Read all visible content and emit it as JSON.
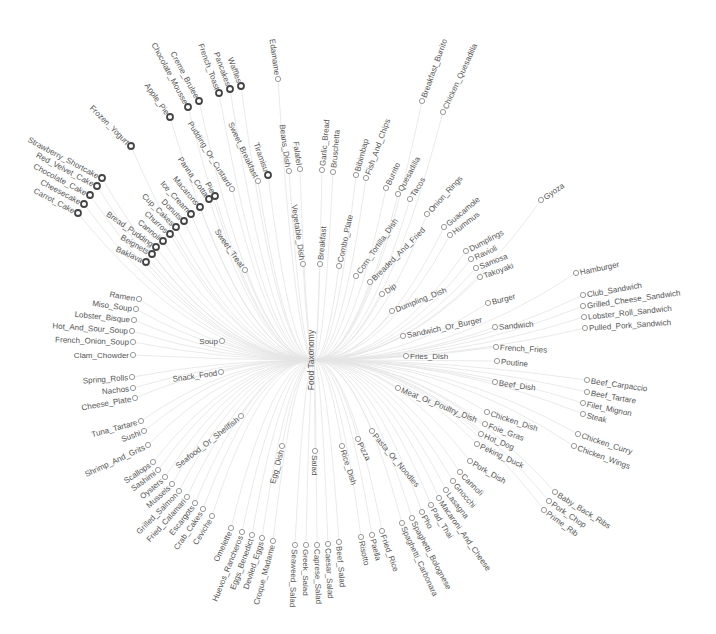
{
  "diagram": {
    "title": "Food Taxonomy",
    "type": "radial-tree",
    "root": {
      "label": "Food Taxonomy",
      "x": 314,
      "y": 360,
      "rot": -90
    },
    "hubs": [
      {
        "label": "Sweet_Treat",
        "x": 245,
        "y": 270,
        "rot": 55,
        "anchor": "end"
      },
      {
        "label": "Soup",
        "x": 222,
        "y": 341,
        "rot": 0,
        "anchor": "end"
      },
      {
        "label": "Snack_Food",
        "x": 221,
        "y": 372,
        "rot": -8,
        "anchor": "end"
      },
      {
        "label": "Seafood_Or_Shellfish",
        "x": 241,
        "y": 416,
        "rot": -38,
        "anchor": "end"
      },
      {
        "label": "Egg_Dish",
        "x": 282,
        "y": 446,
        "rot": -75,
        "anchor": "end"
      },
      {
        "label": "Salad",
        "x": 315,
        "y": 451,
        "rot": 90,
        "anchor": "start"
      },
      {
        "label": "Rice_Dish",
        "x": 342,
        "y": 446,
        "rot": 72,
        "anchor": "start"
      },
      {
        "label": "Pizza",
        "x": 358,
        "y": 439,
        "rot": 62,
        "anchor": "start"
      },
      {
        "label": "Pasta_Or_Noodles",
        "x": 372,
        "y": 431,
        "rot": 50,
        "anchor": "start"
      },
      {
        "label": "Meat_Or_Poultry_Dish",
        "x": 398,
        "y": 388,
        "rot": 22,
        "anchor": "start"
      },
      {
        "label": "Fries_Dish",
        "x": 406,
        "y": 356,
        "rot": 0,
        "anchor": "start"
      },
      {
        "label": "Sandwich_Or_Burger",
        "x": 403,
        "y": 336,
        "rot": -12,
        "anchor": "start"
      },
      {
        "label": "Dumpling_Dish",
        "x": 392,
        "y": 311,
        "rot": -22,
        "anchor": "start"
      },
      {
        "label": "Dip",
        "x": 382,
        "y": 294,
        "rot": -35,
        "anchor": "start"
      },
      {
        "label": "Breaded_And_Fried",
        "x": 370,
        "y": 282,
        "rot": -45,
        "anchor": "start"
      },
      {
        "label": "Corn_Tortilla_Dish",
        "x": 356,
        "y": 276,
        "rot": -55,
        "anchor": "start"
      },
      {
        "label": "Combo_Plate",
        "x": 339,
        "y": 266,
        "rot": -78,
        "anchor": "start"
      },
      {
        "label": "Breakfast",
        "x": 320,
        "y": 264,
        "rot": -85,
        "anchor": "start"
      },
      {
        "label": "Vegetable_Dish",
        "x": 303,
        "y": 264,
        "rot": 82,
        "anchor": "end"
      },
      {
        "label": "Sweet_Breakfast",
        "x": 258,
        "y": 181,
        "rot": 65,
        "anchor": "end"
      },
      {
        "label": "Pudding_Or_Custard",
        "x": 232,
        "y": 189,
        "rot": 58,
        "anchor": "end"
      }
    ],
    "subhubs": [
      {
        "label": "Burger",
        "x": 488,
        "y": 303,
        "rot": -15,
        "anchor": "start"
      },
      {
        "label": "Sandwich",
        "x": 495,
        "y": 327,
        "rot": -5,
        "anchor": "start"
      },
      {
        "label": "Beef_Dish",
        "x": 495,
        "y": 382,
        "rot": 8,
        "anchor": "start"
      },
      {
        "label": "Chicken_Dish",
        "x": 487,
        "y": 412,
        "rot": 18,
        "anchor": "start"
      },
      {
        "label": "Pork_Dish",
        "x": 470,
        "y": 461,
        "rot": 30,
        "anchor": "start"
      }
    ],
    "leaves": [
      {
        "label": "Strawberry_Shortcake",
        "x": 102,
        "y": 178,
        "rot": 28,
        "anchor": "end",
        "dark": true
      },
      {
        "label": "Red_Velvet_Cake",
        "x": 97,
        "y": 186,
        "rot": 28,
        "anchor": "end",
        "dark": true
      },
      {
        "label": "Chocolate_Cake",
        "x": 90,
        "y": 195,
        "rot": 28,
        "anchor": "end",
        "dark": true
      },
      {
        "label": "Cheesecake",
        "x": 84,
        "y": 204,
        "rot": 28,
        "anchor": "end",
        "dark": true
      },
      {
        "label": "Carrot_Cake",
        "x": 78,
        "y": 213,
        "rot": 28,
        "anchor": "end",
        "dark": true
      },
      {
        "label": "Frozen_Yogurt",
        "x": 131,
        "y": 146,
        "rot": 45,
        "anchor": "end",
        "dark": true
      },
      {
        "label": "Apple_Pie",
        "x": 170,
        "y": 117,
        "rot": 55,
        "anchor": "end",
        "dark": true
      },
      {
        "label": "Chocolate_Mousse",
        "x": 188,
        "y": 107,
        "rot": 62,
        "anchor": "end",
        "dark": true
      },
      {
        "label": "Creme_Brulee",
        "x": 199,
        "y": 101,
        "rot": 62,
        "anchor": "end",
        "dark": true
      },
      {
        "label": "French_Toast",
        "x": 219,
        "y": 93,
        "rot": 70,
        "anchor": "end",
        "dark": true
      },
      {
        "label": "Pancakes",
        "x": 230,
        "y": 89,
        "rot": 70,
        "anchor": "end",
        "dark": true
      },
      {
        "label": "Waffles",
        "x": 241,
        "y": 86,
        "rot": 70,
        "anchor": "end",
        "dark": true
      },
      {
        "label": "Edamame",
        "x": 278,
        "y": 79,
        "rot": 82,
        "anchor": "end",
        "dark": false
      },
      {
        "label": "Tiramisu",
        "x": 268,
        "y": 175,
        "rot": 70,
        "anchor": "end",
        "dark": true
      },
      {
        "label": "Panna_Cotta",
        "x": 209,
        "y": 199,
        "rot": 55,
        "anchor": "end",
        "dark": true
      },
      {
        "label": "Pie",
        "x": 215,
        "y": 196,
        "rot": 62,
        "anchor": "end",
        "dark": true
      },
      {
        "label": "Macarons",
        "x": 200,
        "y": 207,
        "rot": 50,
        "anchor": "end",
        "dark": true
      },
      {
        "label": "Ice_Cream",
        "x": 191,
        "y": 214,
        "rot": 48,
        "anchor": "end",
        "dark": true
      },
      {
        "label": "Donuts",
        "x": 184,
        "y": 221,
        "rot": 45,
        "anchor": "end",
        "dark": true
      },
      {
        "label": "Cup_Cakes",
        "x": 176,
        "y": 227,
        "rot": 45,
        "anchor": "end",
        "dark": true
      },
      {
        "label": "Churros",
        "x": 170,
        "y": 234,
        "rot": 42,
        "anchor": "end",
        "dark": true
      },
      {
        "label": "Cannoli",
        "x": 163,
        "y": 241,
        "rot": 40,
        "anchor": "end",
        "dark": true
      },
      {
        "label": "Bread_Pudding",
        "x": 156,
        "y": 247,
        "rot": 35,
        "anchor": "end",
        "dark": true
      },
      {
        "label": "Beignets",
        "x": 152,
        "y": 254,
        "rot": 30,
        "anchor": "end",
        "dark": true
      },
      {
        "label": "Baklava",
        "x": 146,
        "y": 262,
        "rot": 25,
        "anchor": "end",
        "dark": true
      },
      {
        "label": "Beans_Dish",
        "x": 289,
        "y": 171,
        "rot": 82,
        "anchor": "end",
        "dark": false
      },
      {
        "label": "Falafel",
        "x": 300,
        "y": 169,
        "rot": 82,
        "anchor": "end",
        "dark": false
      },
      {
        "label": "Garlic_Bread",
        "x": 322,
        "y": 170,
        "rot": -85,
        "anchor": "start",
        "dark": false
      },
      {
        "label": "Bruschetta",
        "x": 333,
        "y": 172,
        "rot": -85,
        "anchor": "start",
        "dark": false
      },
      {
        "label": "Bibimbap",
        "x": 356,
        "y": 175,
        "rot": -75,
        "anchor": "start",
        "dark": false
      },
      {
        "label": "Fish_And_Chips",
        "x": 366,
        "y": 178,
        "rot": -70,
        "anchor": "start",
        "dark": false
      },
      {
        "label": "Breakfast_Burrito",
        "x": 422,
        "y": 101,
        "rot": -70,
        "anchor": "start",
        "dark": false
      },
      {
        "label": "Chicken_Quesadilla",
        "x": 443,
        "y": 112,
        "rot": -65,
        "anchor": "start",
        "dark": false
      },
      {
        "label": "Burrito",
        "x": 386,
        "y": 188,
        "rot": -65,
        "anchor": "start",
        "dark": false
      },
      {
        "label": "Quesadilla",
        "x": 398,
        "y": 194,
        "rot": -62,
        "anchor": "start",
        "dark": false
      },
      {
        "label": "Tacos",
        "x": 410,
        "y": 199,
        "rot": -58,
        "anchor": "start",
        "dark": false
      },
      {
        "label": "Onion_Rings",
        "x": 427,
        "y": 214,
        "rot": -48,
        "anchor": "start",
        "dark": false
      },
      {
        "label": "Guacamole",
        "x": 444,
        "y": 227,
        "rot": -40,
        "anchor": "start",
        "dark": false
      },
      {
        "label": "Hummus",
        "x": 450,
        "y": 235,
        "rot": -38,
        "anchor": "start",
        "dark": false
      },
      {
        "label": "Gyoza",
        "x": 541,
        "y": 200,
        "rot": -35,
        "anchor": "start",
        "dark": false
      },
      {
        "label": "Dumplings",
        "x": 466,
        "y": 251,
        "rot": -28,
        "anchor": "start",
        "dark": false
      },
      {
        "label": "Ravioli",
        "x": 471,
        "y": 259,
        "rot": -25,
        "anchor": "start",
        "dark": false
      },
      {
        "label": "Samosa",
        "x": 476,
        "y": 268,
        "rot": -22,
        "anchor": "start",
        "dark": false
      },
      {
        "label": "Takoyaki",
        "x": 480,
        "y": 277,
        "rot": -20,
        "anchor": "start",
        "dark": false
      },
      {
        "label": "Hamburger",
        "x": 576,
        "y": 273,
        "rot": -12,
        "anchor": "start",
        "dark": false
      },
      {
        "label": "Club_Sandwich",
        "x": 583,
        "y": 295,
        "rot": -10,
        "anchor": "start",
        "dark": false
      },
      {
        "label": "Grilled_Cheese_Sandwich",
        "x": 583,
        "y": 306,
        "rot": -8,
        "anchor": "start",
        "dark": false
      },
      {
        "label": "Lobster_Roll_Sandwich",
        "x": 584,
        "y": 317,
        "rot": -6,
        "anchor": "start",
        "dark": false
      },
      {
        "label": "Pulled_Pork_Sandwich",
        "x": 585,
        "y": 328,
        "rot": -4,
        "anchor": "start",
        "dark": false
      },
      {
        "label": "French_Fries",
        "x": 496,
        "y": 347,
        "rot": 3,
        "anchor": "start",
        "dark": false
      },
      {
        "label": "Poutine",
        "x": 497,
        "y": 361,
        "rot": 5,
        "anchor": "start",
        "dark": false
      },
      {
        "label": "Beef_Carpaccio",
        "x": 587,
        "y": 380,
        "rot": 8,
        "anchor": "start",
        "dark": false
      },
      {
        "label": "Beef_Tartare",
        "x": 587,
        "y": 392,
        "rot": 10,
        "anchor": "start",
        "dark": false
      },
      {
        "label": "Filet_Mignon",
        "x": 583,
        "y": 403,
        "rot": 12,
        "anchor": "start",
        "dark": false
      },
      {
        "label": "Steak",
        "x": 583,
        "y": 414,
        "rot": 14,
        "anchor": "start",
        "dark": false
      },
      {
        "label": "Foie_Gras",
        "x": 485,
        "y": 424,
        "rot": 20,
        "anchor": "start",
        "dark": false
      },
      {
        "label": "Hot_Dog",
        "x": 481,
        "y": 434,
        "rot": 22,
        "anchor": "start",
        "dark": false
      },
      {
        "label": "Peking_Duck",
        "x": 477,
        "y": 444,
        "rot": 25,
        "anchor": "start",
        "dark": false
      },
      {
        "label": "Chicken_Curry",
        "x": 578,
        "y": 434,
        "rot": 18,
        "anchor": "start",
        "dark": false
      },
      {
        "label": "Chicken_Wings",
        "x": 574,
        "y": 446,
        "rot": 20,
        "anchor": "start",
        "dark": false
      },
      {
        "label": "Baby_Back_Ribs",
        "x": 555,
        "y": 492,
        "rot": 32,
        "anchor": "start",
        "dark": false
      },
      {
        "label": "Pork_Chop",
        "x": 549,
        "y": 501,
        "rot": 34,
        "anchor": "start",
        "dark": false
      },
      {
        "label": "Prime_Rib",
        "x": 544,
        "y": 510,
        "rot": 36,
        "anchor": "start",
        "dark": false
      },
      {
        "label": "Cannoli_Pasta",
        "x": 460,
        "y": 472,
        "rot": 45,
        "anchor": "start",
        "dark": false
      },
      {
        "label": "Gnocchi",
        "x": 453,
        "y": 481,
        "rot": 50,
        "anchor": "start",
        "dark": false
      },
      {
        "label": "Lasagna",
        "x": 446,
        "y": 490,
        "rot": 52,
        "anchor": "start",
        "dark": false
      },
      {
        "label": "Macaroni_And_Cheese",
        "x": 439,
        "y": 498,
        "rot": 55,
        "anchor": "start",
        "dark": false
      },
      {
        "label": "Pad_Thai",
        "x": 431,
        "y": 505,
        "rot": 58,
        "anchor": "start",
        "dark": false
      },
      {
        "label": "Pho",
        "x": 422,
        "y": 512,
        "rot": 60,
        "anchor": "start",
        "dark": false
      },
      {
        "label": "Spaghetti_Bolognese",
        "x": 412,
        "y": 518,
        "rot": 62,
        "anchor": "start",
        "dark": false
      },
      {
        "label": "Spaghetti_Carbonara",
        "x": 402,
        "y": 523,
        "rot": 65,
        "anchor": "start",
        "dark": false
      },
      {
        "label": "Fried_Rice",
        "x": 382,
        "y": 531,
        "rot": 70,
        "anchor": "start",
        "dark": false
      },
      {
        "label": "Paella",
        "x": 372,
        "y": 535,
        "rot": 75,
        "anchor": "start",
        "dark": false
      },
      {
        "label": "Risotto",
        "x": 361,
        "y": 537,
        "rot": 78,
        "anchor": "start",
        "dark": false
      },
      {
        "label": "Beef_Salad",
        "x": 339,
        "y": 542,
        "rot": 85,
        "anchor": "start",
        "dark": false
      },
      {
        "label": "Caesar_Salad",
        "x": 328,
        "y": 544,
        "rot": 87,
        "anchor": "start",
        "dark": false
      },
      {
        "label": "Caprese_Salad",
        "x": 317,
        "y": 545,
        "rot": 88,
        "anchor": "start",
        "dark": false
      },
      {
        "label": "Greek_Salad",
        "x": 306,
        "y": 545,
        "rot": 90,
        "anchor": "start",
        "dark": false
      },
      {
        "label": "Seaweed_Salad",
        "x": 295,
        "y": 545,
        "rot": 92,
        "anchor": "start",
        "dark": false
      },
      {
        "label": "Croque_Madame",
        "x": 273,
        "y": 541,
        "rot": -75,
        "anchor": "end",
        "dark": false
      },
      {
        "label": "Deviled_Eggs",
        "x": 262,
        "y": 538,
        "rot": -72,
        "anchor": "end",
        "dark": false
      },
      {
        "label": "Eggs_Benedict",
        "x": 252,
        "y": 535,
        "rot": -70,
        "anchor": "end",
        "dark": false
      },
      {
        "label": "Huevos_Rancheros",
        "x": 242,
        "y": 532,
        "rot": -68,
        "anchor": "end",
        "dark": false
      },
      {
        "label": "Omelette",
        "x": 231,
        "y": 528,
        "rot": -65,
        "anchor": "end",
        "dark": false
      },
      {
        "label": "Ceviche",
        "x": 212,
        "y": 516,
        "rot": -58,
        "anchor": "end",
        "dark": false
      },
      {
        "label": "Crab_Cakes",
        "x": 203,
        "y": 509,
        "rot": -55,
        "anchor": "end",
        "dark": false
      },
      {
        "label": "Escargots",
        "x": 195,
        "y": 503,
        "rot": -52,
        "anchor": "end",
        "dark": false
      },
      {
        "label": "Fried_Calamari",
        "x": 187,
        "y": 497,
        "rot": -48,
        "anchor": "end",
        "dark": false
      },
      {
        "label": "Grilled_Salmon",
        "x": 179,
        "y": 491,
        "rot": -45,
        "anchor": "end",
        "dark": false
      },
      {
        "label": "Mussels",
        "x": 172,
        "y": 484,
        "rot": -42,
        "anchor": "end",
        "dark": false
      },
      {
        "label": "Oysters",
        "x": 165,
        "y": 477,
        "rot": -40,
        "anchor": "end",
        "dark": false
      },
      {
        "label": "Sashimi",
        "x": 158,
        "y": 470,
        "rot": -36,
        "anchor": "end",
        "dark": false
      },
      {
        "label": "Scallops",
        "x": 153,
        "y": 462,
        "rot": -34,
        "anchor": "end",
        "dark": false
      },
      {
        "label": "Shrimp_And_Grits",
        "x": 148,
        "y": 445,
        "rot": -25,
        "anchor": "end",
        "dark": false
      },
      {
        "label": "Sushi",
        "x": 144,
        "y": 431,
        "rot": -20,
        "anchor": "end",
        "dark": false
      },
      {
        "label": "Tuna_Tartare",
        "x": 141,
        "y": 421,
        "rot": -15,
        "anchor": "end",
        "dark": false
      },
      {
        "label": "Cheese_Plate",
        "x": 135,
        "y": 398,
        "rot": -10,
        "anchor": "end",
        "dark": false
      },
      {
        "label": "Nachos",
        "x": 133,
        "y": 388,
        "rot": -6,
        "anchor": "end",
        "dark": false
      },
      {
        "label": "Spring_Rolls",
        "x": 132,
        "y": 377,
        "rot": -4,
        "anchor": "end",
        "dark": false
      },
      {
        "label": "Clam_Chowder",
        "x": 133,
        "y": 355,
        "rot": 0,
        "anchor": "end",
        "dark": false
      },
      {
        "label": "French_Onion_Soup",
        "x": 133,
        "y": 342,
        "rot": 2,
        "anchor": "end",
        "dark": false
      },
      {
        "label": "Hot_And_Sour_Soup",
        "x": 132,
        "y": 331,
        "rot": 4,
        "anchor": "end",
        "dark": false
      },
      {
        "label": "Lobster_Bisque",
        "x": 134,
        "y": 320,
        "rot": 6,
        "anchor": "end",
        "dark": false
      },
      {
        "label": "Miso_Soup",
        "x": 136,
        "y": 309,
        "rot": 8,
        "anchor": "end",
        "dark": false
      },
      {
        "label": "Ramen",
        "x": 139,
        "y": 299,
        "rot": 10,
        "anchor": "end",
        "dark": false
      }
    ]
  }
}
